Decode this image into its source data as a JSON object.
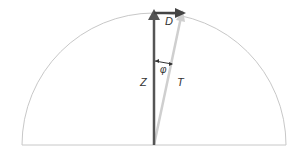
{
  "diagram": {
    "labels": {
      "D": "D",
      "Z": "Z",
      "T": "T",
      "phi": "φ"
    },
    "colors": {
      "circle": "#c8c8c8",
      "Z_vector": "#555555",
      "D_vector": "#444444",
      "T_vector": "#c8c8c8"
    }
  }
}
